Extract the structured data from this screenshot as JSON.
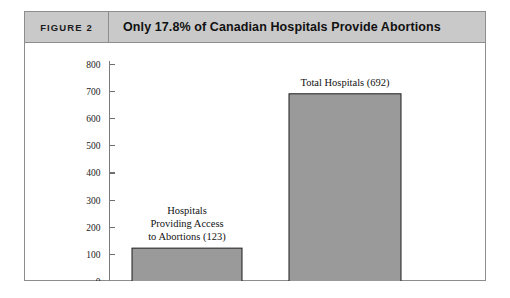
{
  "figure": {
    "number_label": "FIGURE 2",
    "title": "Only 17.8% of Canadian Hospitals Provide Abortions"
  },
  "colors": {
    "header_background": "#c9c9c9",
    "frame_border": "#8d8d8d",
    "bar_fill": "#9a9a9a",
    "bar_outline": "#1c1c1c",
    "axis": "#7b7b7b",
    "text": "#121212"
  },
  "chart_data": {
    "type": "bar",
    "title": "Only 17.8% of Canadian Hospitals Provide Abortions",
    "xlabel": "",
    "ylabel": "",
    "ylim": [
      0,
      800
    ],
    "yticks": [
      0,
      100,
      200,
      300,
      400,
      500,
      600,
      700,
      800
    ],
    "ytick_labels": [
      "0",
      "100",
      "200",
      "300",
      "400",
      "500",
      "600",
      "700",
      "800"
    ],
    "grid": false,
    "legend": false,
    "categories": [
      "Hospitals Providing Access to Abortions",
      "Total Hospitals"
    ],
    "values": [
      123,
      692
    ],
    "data_labels": [
      [
        "Hospitals",
        "Providing Access",
        "to Abortions (123)"
      ],
      [
        "Total Hospitals (692)"
      ]
    ]
  }
}
